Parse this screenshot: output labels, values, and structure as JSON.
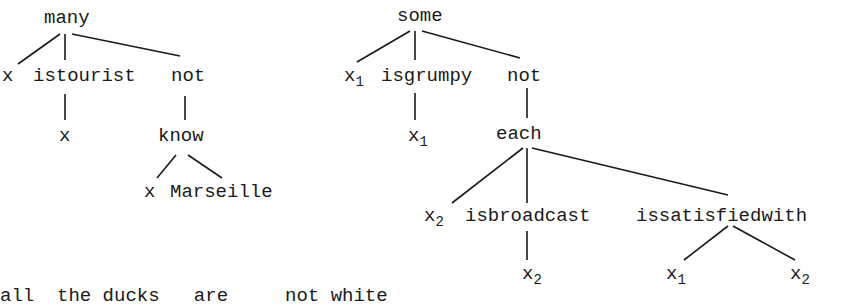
{
  "trees": [
    {
      "id": "left",
      "root": "many",
      "nodes": {
        "many": "many",
        "x_var": "x",
        "istourist": "istourist",
        "not": "not",
        "istourist_arg": "x",
        "know": "know",
        "know_arg1": "x",
        "know_arg2": "Marseille"
      }
    },
    {
      "id": "right",
      "root": "some",
      "nodes": {
        "some": "some",
        "x1_var": "x",
        "x1_var_sub": "1",
        "isgrumpy": "isgrumpy",
        "not": "not",
        "isgrumpy_arg": "x",
        "isgrumpy_arg_sub": "1",
        "each": "each",
        "x2_var": "x",
        "x2_var_sub": "2",
        "isbroadcast": "isbroadcast",
        "issatisfiedwith": "issatisfiedwith",
        "isbroadcast_arg": "x",
        "isbroadcast_arg_sub": "2",
        "issat_arg1": "x",
        "issat_arg1_sub": "1",
        "issat_arg2": "x",
        "issat_arg2_sub": "2"
      }
    }
  ],
  "caption": "all  the ducks   are     not white"
}
